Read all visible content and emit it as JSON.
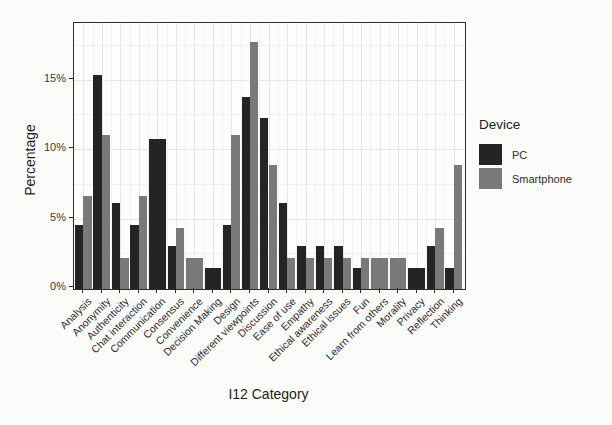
{
  "chart_data": {
    "type": "bar",
    "title": "",
    "xlabel": "I12 Category",
    "ylabel": "Percentage",
    "legend_title": "Device",
    "legend_position": "right",
    "grid": true,
    "ylim": [
      0,
      19
    ],
    "ytick_values": [
      0,
      5,
      10,
      15
    ],
    "ytick_labels": [
      "0%",
      "5%",
      "10%",
      "15%"
    ],
    "categories": [
      "Analysis",
      "Anonymity",
      "Authenticity",
      "Chat interaction",
      "Communication",
      "Consensus",
      "Convenience",
      "Decision Making",
      "Design",
      "Different viewpoints",
      "Discussion",
      "Ease of use",
      "Empathy",
      "Ethical awareness",
      "Ethical issues",
      "Fun",
      "Learn from others",
      "Morality",
      "Privacy",
      "Reflection",
      "Thinking"
    ],
    "series": [
      {
        "name": "PC",
        "color": "#242424",
        "values": [
          4.6,
          15.4,
          6.2,
          4.6,
          10.8,
          3.1,
          null,
          1.5,
          4.6,
          13.8,
          12.3,
          6.2,
          3.1,
          3.1,
          3.1,
          1.5,
          null,
          null,
          1.5,
          3.1,
          1.5
        ]
      },
      {
        "name": "Smartphone",
        "color": "#797979",
        "values": [
          6.7,
          11.1,
          2.2,
          6.7,
          null,
          4.4,
          2.2,
          null,
          11.1,
          17.8,
          8.9,
          2.2,
          2.2,
          2.2,
          2.2,
          2.2,
          2.2,
          2.2,
          null,
          4.4,
          8.9
        ]
      }
    ]
  },
  "style_colors": {
    "major_grid": "#e4e6e7",
    "minor_grid": "#f0f2f2",
    "axis": "#2b2b2b"
  }
}
